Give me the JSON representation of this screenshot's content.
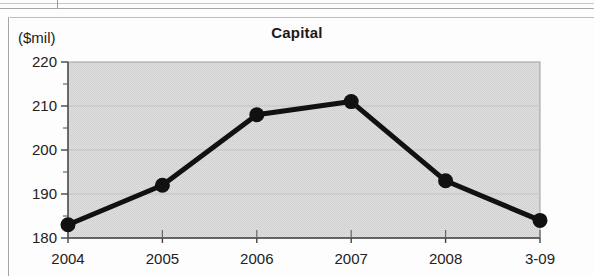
{
  "chart_data": {
    "type": "line",
    "title": "Capital",
    "ylabel": "($mil)",
    "xlabel": "",
    "categories": [
      "2004",
      "2005",
      "2006",
      "2007",
      "2008",
      "3-09"
    ],
    "values": [
      183,
      192,
      208,
      211,
      193,
      184
    ],
    "ylim": [
      180,
      220
    ],
    "yticks": [
      180,
      190,
      200,
      210,
      220
    ],
    "yticks_minor": [
      185,
      195,
      205,
      215
    ],
    "grid": true,
    "legend": "none",
    "series": [
      {
        "name": "Capital",
        "values": [
          183,
          192,
          208,
          211,
          193,
          184
        ]
      }
    ],
    "colors": {
      "line": "#111111",
      "marker": "#111111",
      "plot_background": "#dcdcdc",
      "axis": "#555555",
      "gridline": "#c3c3c3",
      "text": "#1a1a1a"
    }
  },
  "artifacts": {
    "description": "scanned-page-lines"
  }
}
